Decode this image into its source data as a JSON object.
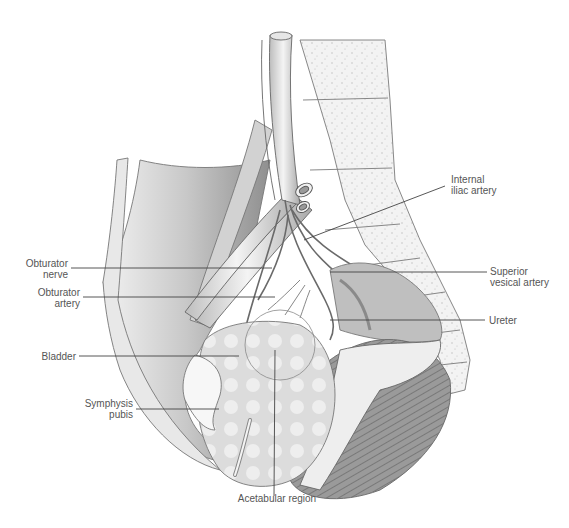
{
  "figure": {
    "type": "anatomical illustration"
  },
  "colors": {
    "background": "#ffffff",
    "label_text": "#555555",
    "leader_line": "#444444",
    "drawing_line": "#6a6a6a",
    "shading_dark": "#8c8c8c",
    "shading_light": "#d9d9d9"
  },
  "labels": {
    "obturator_nerve": "Obturator\nnerve",
    "obturator_artery": "Obturator\nartery",
    "bladder": "Bladder",
    "symphysis_pubis": "Symphysis\npubis",
    "internal_iliac_artery": "Internal\niliac artery",
    "superior_vesical_artery": "Superior\nvesical artery",
    "ureter": "Ureter",
    "acetabular_region": "Acetabular region"
  }
}
